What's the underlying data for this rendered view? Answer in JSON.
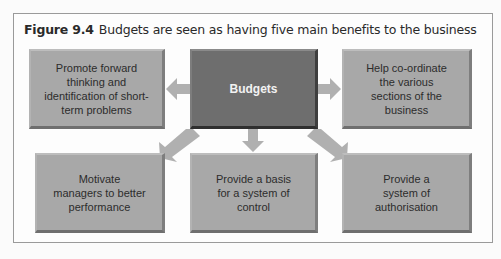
{
  "figure": {
    "number": "Figure 9.4",
    "caption": "Budgets are seen as having five main benefits to the business"
  },
  "center": {
    "label": "Budgets"
  },
  "benefits": [
    {
      "position": "top-left",
      "label": "Promote forward thinking and identification of short-term problems"
    },
    {
      "position": "top-right",
      "label": "Help co-ordinate the various sections of the business"
    },
    {
      "position": "bottom-left",
      "label": "Motivate managers to better performance"
    },
    {
      "position": "bottom-center",
      "label": "Provide a basis for a system of control"
    },
    {
      "position": "bottom-right",
      "label": "Provide a system of authorisation"
    }
  ],
  "colors": {
    "center_box": "#6e6e6e",
    "benefit_box": "#a8a8a8",
    "arrow": "#b0b0b0",
    "frame_border": "#9a9a9a"
  }
}
